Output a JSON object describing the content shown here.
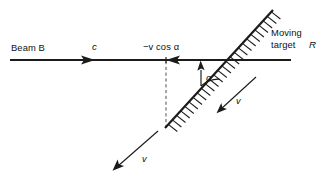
{
  "figure": {
    "type": "physics-vector-diagram",
    "background_color": "#ffffff",
    "ink_color": "#1b1b1b"
  },
  "labels": {
    "beam": "Beam B",
    "beam_speed": "c",
    "component": "−v cos α",
    "angle": "α",
    "target_line1": "Moving",
    "target_line2": "target",
    "target_symbol": "R",
    "velocity_surface": "v",
    "velocity_lower": "v"
  },
  "elements": {
    "beam_axis": {
      "name": "horizontal-beam-axis",
      "x1": 10,
      "y1": 60,
      "x2": 291,
      "y2": 60
    },
    "beam_arrowhead": {
      "name": "beam-direction-arrowhead",
      "direction": "right",
      "tip_x": 95,
      "tip_y": 60
    },
    "component_arrowhead": {
      "name": "component-direction-arrowhead",
      "direction": "left",
      "tip_x": 166,
      "tip_y": 60
    },
    "inclined_surface": {
      "name": "inclined-target-surface",
      "x1": 165,
      "y1": 128,
      "x2": 273,
      "y2": 10,
      "hatch_side": "lower-right",
      "hatch_count": 26
    },
    "dashed_normal": {
      "name": "dashed-vertical-reference",
      "x1": 166,
      "y1": 61,
      "x2": 166,
      "y2": 128
    },
    "angle_arc": {
      "name": "angle-arc-alpha",
      "vertex_x": 201,
      "vertex_y": 60,
      "radius": 26,
      "label_x": 209,
      "label_y": 79
    },
    "surface_velocity_arrow": {
      "name": "surface-velocity-arrow",
      "x1": 256,
      "y1": 77,
      "x2": 217,
      "y2": 113,
      "label_x": 239,
      "label_y": 101
    },
    "lower_velocity_arrow": {
      "name": "lower-velocity-arrow",
      "x1": 158,
      "y1": 131,
      "x2": 113,
      "y2": 170,
      "label_x": 145,
      "label_y": 159
    }
  },
  "text_positions": {
    "beam_x": 11,
    "beam_y": 51,
    "beam_speed_x": 95,
    "beam_speed_y": 51,
    "component_x": 145,
    "component_y": 51,
    "target_x": 271,
    "target_y": 41,
    "target_y2": 52
  }
}
